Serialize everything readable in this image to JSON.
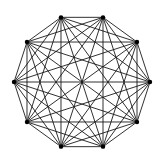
{
  "diagram": {
    "type": "complete-graph",
    "vertex_count": 10,
    "center": [
      82,
      82
    ],
    "radius": 68,
    "start_angle_deg": -108,
    "edge_color": "#1a1a1a",
    "vertex_color": "#000000",
    "background": "#ffffff"
  }
}
